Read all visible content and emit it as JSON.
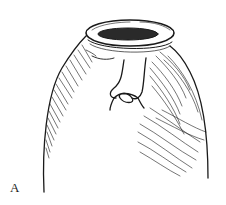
{
  "figure": {
    "label": "A",
    "ink_color": "#1a1a1a",
    "background": "#ffffff"
  }
}
